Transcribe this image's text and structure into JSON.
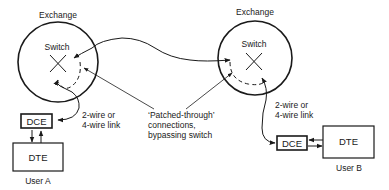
{
  "diagram": {
    "left_exchange": {
      "title": "Exchange",
      "switch_label": "Switch",
      "dce_label": "DCE",
      "dte_label": "DTE",
      "user_label": "User A",
      "link_label_line1": "2-wire or",
      "link_label_line2": "4-wire link"
    },
    "right_exchange": {
      "title": "Exchange",
      "switch_label": "Switch",
      "dce_label": "DCE",
      "dte_label": "DTE",
      "user_label": "User B",
      "link_label_line1": "2-wire or",
      "link_label_line2": "4-wire link"
    },
    "annotation": {
      "line1": "‘Patched-through’",
      "line2": "connections,",
      "line3": "bypassing switch"
    }
  }
}
